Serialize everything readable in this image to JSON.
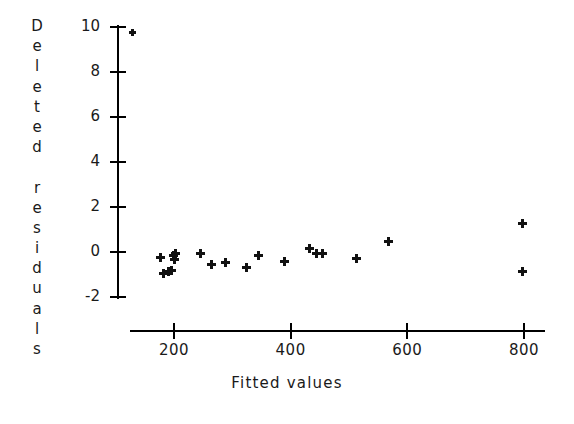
{
  "chart_data": {
    "type": "scatter",
    "title": "",
    "xlabel": "Fitted values",
    "ylabel": "Deleted residuals",
    "xlim": [
      120,
      860
    ],
    "ylim": [
      -2.9,
      10.6
    ],
    "xticks": [
      200,
      400,
      600,
      800
    ],
    "xtick_labels": [
      "200",
      "400",
      "600",
      "800"
    ],
    "yticks": [
      10,
      8,
      6,
      4,
      2,
      0,
      -2
    ],
    "ytick_labels": [
      "10",
      "8",
      "6",
      "4",
      "2",
      "0",
      "-2"
    ],
    "grid": false,
    "legend": null,
    "marker": "plus",
    "marker_color": "#111111",
    "points": [
      {
        "x": 128,
        "y": 9.75
      },
      {
        "x": 176,
        "y": -0.25
      },
      {
        "x": 182,
        "y": -0.95
      },
      {
        "x": 191,
        "y": -0.85
      },
      {
        "x": 196,
        "y": -0.8
      },
      {
        "x": 199,
        "y": -0.15
      },
      {
        "x": 201,
        "y": -0.35
      },
      {
        "x": 202,
        "y": -0.05
      },
      {
        "x": 246,
        "y": -0.05
      },
      {
        "x": 265,
        "y": -0.55
      },
      {
        "x": 288,
        "y": -0.45
      },
      {
        "x": 324,
        "y": -0.7
      },
      {
        "x": 345,
        "y": -0.15
      },
      {
        "x": 390,
        "y": -0.4
      },
      {
        "x": 432,
        "y": 0.15
      },
      {
        "x": 445,
        "y": -0.05
      },
      {
        "x": 455,
        "y": -0.05
      },
      {
        "x": 513,
        "y": -0.3
      },
      {
        "x": 568,
        "y": 0.45
      },
      {
        "x": 797,
        "y": 1.25
      },
      {
        "x": 797,
        "y": -0.85
      }
    ]
  },
  "axes": {
    "y_title_chars": [
      "D",
      "e",
      "l",
      "e",
      "t",
      "e",
      "d",
      " ",
      "r",
      "e",
      "s",
      "i",
      "d",
      "u",
      "a",
      "l",
      "s"
    ]
  }
}
